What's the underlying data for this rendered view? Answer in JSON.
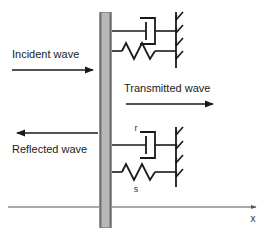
{
  "figure": {
    "background_color": "#ffffff",
    "line_color": "#1a1a1a",
    "axis_color": "#555555",
    "barrier_fill": "#b8b8b8",
    "barrier_edge": "#6e6e6e"
  },
  "labels": {
    "incident_wave": "Incident wave",
    "transmitted_wave": "Transmitted wave",
    "reflected_wave": "Reflected wave",
    "dashpot_symbol": "r",
    "spring_symbol": "s",
    "axis_x": "x"
  },
  "elements": {
    "barrier": {
      "name": "interface-barrier",
      "x": 99,
      "y": 12,
      "width": 13,
      "height": 216
    },
    "assemblies": [
      {
        "name": "upper-assembly",
        "dashpot_y": 31,
        "spring_y": 51,
        "ground_x": 176,
        "ground_top": 12,
        "ground_bottom": 68,
        "has_symbols": false
      },
      {
        "name": "lower-assembly",
        "dashpot_y": 145,
        "spring_y": 172,
        "ground_x": 176,
        "ground_top": 127,
        "ground_bottom": 187,
        "has_symbols": true
      }
    ],
    "arrows": [
      {
        "name": "incident-wave-arrow",
        "x1": 12,
        "y1": 70,
        "x2": 96,
        "y2": 70,
        "direction": "right"
      },
      {
        "name": "transmitted-wave-arrow",
        "x1": 124,
        "y1": 104,
        "x2": 216,
        "y2": 104,
        "direction": "right"
      },
      {
        "name": "reflected-wave-arrow",
        "x1": 98,
        "y1": 133,
        "x2": 14,
        "y2": 133,
        "direction": "left"
      },
      {
        "name": "x-axis-arrow",
        "x1": 8,
        "y1": 207,
        "x2": 258,
        "y2": 207,
        "direction": "right"
      }
    ]
  }
}
